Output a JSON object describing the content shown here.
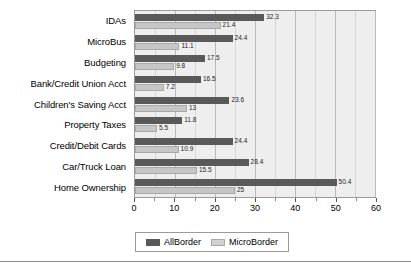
{
  "chart_data": {
    "type": "bar",
    "orientation": "horizontal",
    "title": "",
    "xlabel": "",
    "ylabel": "",
    "xlim": [
      0,
      60
    ],
    "xticks": [
      0,
      10,
      20,
      30,
      40,
      50,
      60
    ],
    "xtick_labels": [
      "0",
      "10",
      "20",
      "30",
      "40",
      "50",
      "60"
    ],
    "minor_tick_step": 5,
    "grid": true,
    "legend_position": "bottom-center",
    "categories": [
      "IDAs",
      "MicroBus",
      "Budgeting",
      "Bank/Credit Union Acct",
      "Children's Saving Acct",
      "Property Taxes",
      "Credit/Debit Cards",
      "Car/Truck Loan",
      "Home Ownership"
    ],
    "series": [
      {
        "name": "AllBorder",
        "color": "#595959",
        "values": [
          32.3,
          24.4,
          17.5,
          16.5,
          23.6,
          11.8,
          24.4,
          28.4,
          50.4
        ],
        "labels": [
          "32.3",
          "24.4",
          "17.5",
          "16.5",
          "23.6",
          "11.8",
          "24.4",
          "28.4",
          "50.4"
        ]
      },
      {
        "name": "MicroBorder",
        "color": "#c6c6c6",
        "values": [
          21.4,
          11.1,
          9.8,
          7.2,
          13,
          5.5,
          10.9,
          15.5,
          25
        ],
        "labels": [
          "21.4",
          "11.1",
          "9.8",
          "7.2",
          "13",
          "5.5",
          "10.9",
          "15.5",
          "25"
        ]
      }
    ]
  },
  "legend": {
    "items": [
      {
        "label": "AllBorder"
      },
      {
        "label": "MicroBorder"
      }
    ]
  }
}
